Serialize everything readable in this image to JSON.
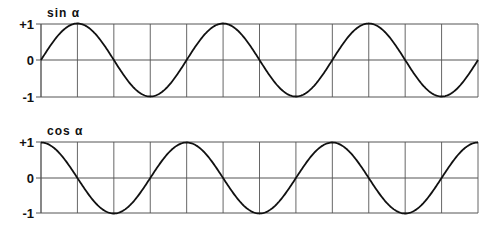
{
  "chart_data": [
    {
      "type": "line",
      "title": "sin α",
      "xlabel": "",
      "ylabel": "",
      "yticks": [
        "+1",
        "0",
        "-1"
      ],
      "ylim": [
        -1,
        1
      ],
      "grid": true,
      "x_divisions": 12,
      "cycles": 3,
      "function": "sin",
      "x": [
        0,
        90,
        180,
        270,
        360,
        450,
        540,
        630,
        720,
        810,
        900,
        990,
        1080
      ],
      "values": [
        0,
        1,
        0,
        -1,
        0,
        1,
        0,
        -1,
        0,
        1,
        0,
        -1,
        0
      ]
    },
    {
      "type": "line",
      "title": "cos α",
      "xlabel": "",
      "ylabel": "",
      "yticks": [
        "+1",
        "0",
        "-1"
      ],
      "ylim": [
        -1,
        1
      ],
      "grid": true,
      "x_divisions": 12,
      "cycles": 3,
      "function": "cos",
      "x": [
        0,
        90,
        180,
        270,
        360,
        450,
        540,
        630,
        720,
        810,
        900,
        990,
        1080
      ],
      "values": [
        1,
        0,
        -1,
        0,
        1,
        0,
        -1,
        0,
        1,
        0,
        -1,
        0,
        1
      ]
    }
  ],
  "charts": {
    "sin": {
      "title": "sin α",
      "ytick_top": "+1",
      "ytick_mid": "0",
      "ytick_bot": "-1"
    },
    "cos": {
      "title": "cos α",
      "ytick_top": "+1",
      "ytick_mid": "0",
      "ytick_bot": "-1"
    }
  },
  "colors": {
    "line": "#111111",
    "grid": "#555555",
    "background": "#ffffff"
  }
}
